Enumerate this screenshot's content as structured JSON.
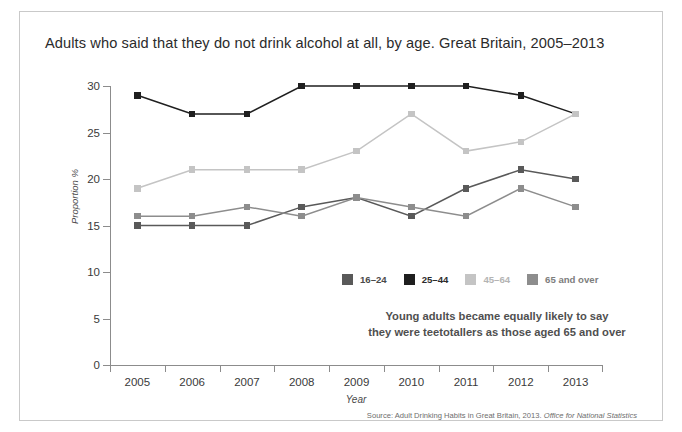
{
  "chart_data": {
    "type": "line",
    "title": "Adults who said that they do not drink alcohol at all, by age. Great Britain, 2005–2013",
    "xlabel": "Year",
    "ylabel": "Proportion %",
    "ylim": [
      0,
      30
    ],
    "yticks": [
      0,
      5,
      10,
      15,
      20,
      25,
      30
    ],
    "xticks": [
      "2005",
      "2006",
      "2007",
      "2008",
      "2009",
      "2010",
      "2011",
      "2012",
      "2013"
    ],
    "x": [
      2005,
      2006,
      2007,
      2008,
      2009,
      2010,
      2011,
      2012,
      2013
    ],
    "grid": false,
    "legend_position": "inside-lower-center",
    "series": [
      {
        "name": "16–24",
        "color": "#595959",
        "values": [
          15,
          15,
          15,
          17,
          18,
          16,
          19,
          21,
          20
        ]
      },
      {
        "name": "25–44",
        "color": "#1f1f1f",
        "values": [
          29,
          27,
          27,
          30,
          30,
          30,
          30,
          29,
          27
        ]
      },
      {
        "name": "45–64",
        "color": "#c4c4c4",
        "values": [
          19,
          21,
          21,
          21,
          23,
          27,
          23,
          24,
          27
        ]
      },
      {
        "name": "65 and over",
        "color": "#8d8d8d",
        "values": [
          16,
          16,
          17,
          16,
          18,
          17,
          16,
          19,
          17
        ]
      }
    ],
    "annotation_lines": [
      "Young adults became equally likely to say",
      "they were teetotallers as those aged 65 and over"
    ],
    "source_prefix": "Source: Adult Drinking Habits in Great Britain, 2013.",
    "source_publisher": "Office for National Statistics"
  },
  "legend": {
    "items": [
      {
        "label": "16–24",
        "color": "#595959",
        "text_color": "#4a4a4a"
      },
      {
        "label": "25–44",
        "color": "#1f1f1f",
        "text_color": "#2b2b2b"
      },
      {
        "label": "45–64",
        "color": "#c4c4c4",
        "text_color": "#b4b4b4"
      },
      {
        "label": "65 and over",
        "color": "#8d8d8d",
        "text_color": "#7d7d7d"
      }
    ]
  },
  "axis": {
    "y_labels": [
      "30",
      "25",
      "20",
      "15",
      "10",
      "5",
      "0"
    ],
    "x_labels": [
      "2005",
      "2006",
      "2007",
      "2008",
      "2009",
      "2010",
      "2011",
      "2012",
      "2013"
    ]
  }
}
